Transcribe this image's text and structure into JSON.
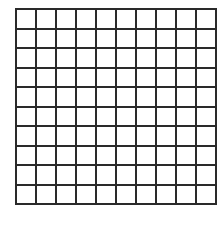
{
  "diagram": {
    "type": "grid",
    "rows": 10,
    "columns": 10,
    "cell_fill": "#ffffff",
    "line_color": "#2a2a2a",
    "shaded_cells": []
  }
}
